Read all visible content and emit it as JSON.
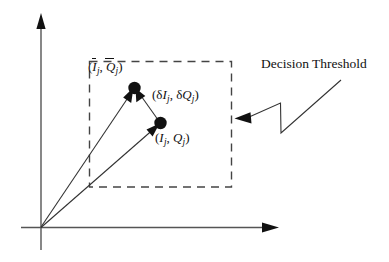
{
  "figure": {
    "title": "",
    "background_color": "#ffffff",
    "ink_color": "#111111"
  },
  "axes": {
    "y_axis": {
      "name": "vertical-axis",
      "arrow": "up"
    },
    "x_axis": {
      "name": "horizontal-axis",
      "arrow": "right"
    },
    "origin_label": ""
  },
  "decision_region": {
    "style": "dashed-rectangle",
    "callout_label": "Decision Threshold"
  },
  "points": [
    {
      "id": "mean-point",
      "label_parts": {
        "open": "(",
        "var1": "I",
        "sub1": "j",
        "comma": ", ",
        "var2": "Q",
        "sub2": "j",
        "close": ")"
      },
      "overbar": true,
      "label_text": "(Ī_j, Q̄_j)"
    },
    {
      "id": "sample-point",
      "label_parts": {
        "open": "(",
        "var1": "I",
        "sub1": "j",
        "comma": ", ",
        "var2": "Q",
        "sub2": "j",
        "close": ")"
      },
      "overbar": false,
      "label_text": "(I_j, Q_j)"
    }
  ],
  "error_vector": {
    "id": "error-vector",
    "label_parts": {
      "open": "(",
      "delta1": "δ",
      "var1": "I",
      "sub1": "j",
      "comma": ", ",
      "delta2": "δ",
      "var2": "Q",
      "sub2": "j",
      "close": ")"
    },
    "label_text": "(δI_j, δQ_j)"
  },
  "callout": {
    "text": "Decision Threshold",
    "leader": "zigzag-with-arrowhead"
  }
}
